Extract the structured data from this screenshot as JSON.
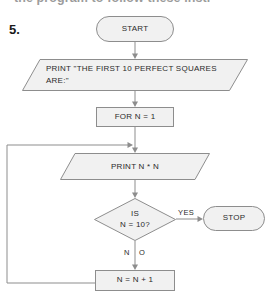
{
  "page": {
    "header_fragment": "the program to follow these instr",
    "item_number": "5."
  },
  "flowchart": {
    "title": "Perfect squares flowchart",
    "nodes": [
      {
        "id": "start",
        "type": "terminator",
        "label": "START"
      },
      {
        "id": "print_hdr",
        "type": "io",
        "label": "PRINT \"THE FIRST 10 PERFECT SQUARES ARE:\""
      },
      {
        "id": "for_n",
        "type": "process",
        "label": "FOR N = 1"
      },
      {
        "id": "print_sq",
        "type": "io",
        "label": "PRINT N * N"
      },
      {
        "id": "decision",
        "type": "decision",
        "label_line1": "IS",
        "label_line2": "N = 10?"
      },
      {
        "id": "stop",
        "type": "terminator",
        "label": "STOP"
      },
      {
        "id": "increment",
        "type": "process",
        "label": "N = N + 1"
      }
    ],
    "edge_labels": {
      "yes": "YES",
      "no_left": "N",
      "no_right": "O"
    },
    "colors": {
      "shape_fill": "#f1f1f1",
      "shape_stroke": "#8d8d8d",
      "text": "#2b2b2b"
    }
  }
}
